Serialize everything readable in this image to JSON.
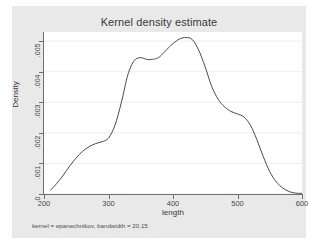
{
  "chart_data": {
    "type": "line",
    "title": "Kernel density estimate",
    "xlabel": "length",
    "ylabel": "Density",
    "note": "kernel = epanechnikov, bandwidth = 20.15",
    "xlim": [
      200,
      600
    ],
    "ylim": [
      0,
      0.0053
    ],
    "grid": "horizontal",
    "legend": "none",
    "xticks": [
      {
        "value": 200,
        "label": "200"
      },
      {
        "value": 300,
        "label": "300"
      },
      {
        "value": 400,
        "label": "400"
      },
      {
        "value": 500,
        "label": "500"
      },
      {
        "value": 600,
        "label": "600"
      }
    ],
    "yticks": [
      {
        "value": 0,
        "label": "0"
      },
      {
        "value": 0.001,
        "label": ".001"
      },
      {
        "value": 0.002,
        "label": ".002"
      },
      {
        "value": 0.003,
        "label": ".003"
      },
      {
        "value": 0.004,
        "label": ".004"
      },
      {
        "value": 0.005,
        "label": ".005"
      }
    ],
    "series": [
      {
        "name": "Density",
        "color": "#4a4a4a",
        "x": [
          210,
          220,
          230,
          240,
          250,
          260,
          270,
          280,
          290,
          300,
          310,
          320,
          330,
          340,
          350,
          360,
          370,
          375,
          380,
          390,
          400,
          410,
          420,
          430,
          440,
          450,
          460,
          470,
          480,
          490,
          500,
          510,
          520,
          530,
          540,
          550,
          560,
          570,
          580,
          590,
          600
        ],
        "y": [
          0.00012,
          0.00035,
          0.00062,
          0.00092,
          0.00118,
          0.0014,
          0.00155,
          0.00165,
          0.00171,
          0.00183,
          0.00225,
          0.003,
          0.0039,
          0.00437,
          0.00446,
          0.0044,
          0.00441,
          0.00444,
          0.0045,
          0.00472,
          0.00492,
          0.00507,
          0.00512,
          0.00505,
          0.0047,
          0.00415,
          0.00352,
          0.0031,
          0.00285,
          0.0027,
          0.00262,
          0.00252,
          0.00225,
          0.00178,
          0.00122,
          0.00073,
          0.0004,
          0.0002,
          8e-05,
          3e-05,
          2e-05
        ]
      }
    ],
    "accent_color": "#4a4a4a",
    "canvas_color": "#e9e9e9",
    "plot_color": "#ffffff"
  }
}
